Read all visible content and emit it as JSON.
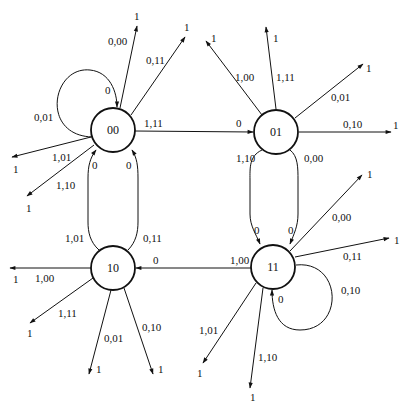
{
  "diagram": {
    "type": "state-transition-diagram",
    "states": [
      {
        "id": "00",
        "label": "00"
      },
      {
        "id": "01",
        "label": "01"
      },
      {
        "id": "10",
        "label": "10"
      },
      {
        "id": "11",
        "label": "11"
      }
    ],
    "labels": {
      "s00_selfloop_out": "0,01",
      "s00_selfloop_in": "0",
      "s00_out_000": "0,00",
      "s00_out_000_t": "1",
      "s00_out_011": "0,11",
      "s00_out_011_t": "1",
      "s00_out_101": "1,01",
      "s00_out_101_t": "1",
      "s00_out_110": "1,10",
      "s00_out_110_t": "1",
      "s00_to_01": "1,11",
      "s00_to_01_in": "0",
      "s01_out_100": "1,00",
      "s01_out_100_t": "1",
      "s01_out_111": "1,11",
      "s01_out_111_t": "1",
      "s01_out_001": "0,01",
      "s01_out_001_t": "1",
      "s01_out_010": "0,10",
      "s01_out_010_t": "1",
      "s01_to_11_a": "1,10",
      "s01_to_11_a_in": "0",
      "s01_to_11_b": "0,00",
      "s01_to_11_b_in": "0",
      "s10_to_00_a": "1,01",
      "s10_to_00_a_in": "0",
      "s10_to_00_b": "0,11",
      "s10_to_00_b_in": "0",
      "s10_out_100": "1,00",
      "s10_out_100_t": "1",
      "s10_out_111": "1,11",
      "s10_out_111_t": "1",
      "s10_out_001": "0,01",
      "s10_out_001_t": "1",
      "s10_out_010": "0,10",
      "s10_out_010_t": "1",
      "s11_to_10": "1,00",
      "s11_to_10_in": "0",
      "s11_out_000": "0,00",
      "s11_out_000_t": "1",
      "s11_out_011": "0,11",
      "s11_out_011_t": "1",
      "s11_selfloop_out": "0,10",
      "s11_selfloop_in": "0",
      "s11_out_101": "1,01",
      "s11_out_101_t": "1",
      "s11_out_110": "1,10",
      "s11_out_110_t": "1"
    }
  }
}
